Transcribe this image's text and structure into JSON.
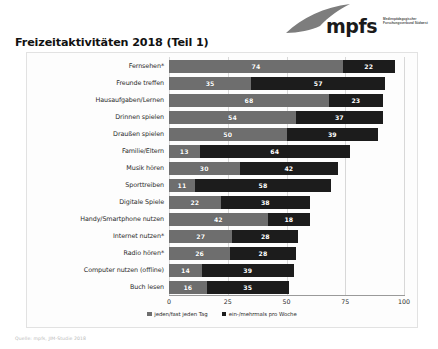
{
  "logo": {
    "wordmark": "mpfs",
    "subtext": "Medienpädagogischer Forschungsverbund Südwest",
    "swoosh_icon": "swoosh-icon",
    "color": "#6e6e6e"
  },
  "page_title": "Freizeitaktivitäten 2018 (Teil 1)",
  "footer_note": "Quelle: mpfs, JIM-Studie 2018",
  "colors": {
    "series_a": "#6e6e6e",
    "series_b": "#1c1c1c",
    "grid": "#d8d8d8",
    "axis": "#9a9a9a"
  },
  "chart_data": {
    "type": "bar",
    "orientation": "horizontal",
    "stacked": true,
    "title": "Freizeitaktivitäten 2018 (Teil 1)",
    "xlabel": "",
    "ylabel": "",
    "xlim": [
      0,
      100
    ],
    "xticks": [
      0,
      25,
      50,
      75,
      100
    ],
    "grid": true,
    "legend_position": "bottom",
    "categories": [
      "Fernsehen*",
      "Freunde treffen",
      "Hausaufgaben/Lernen",
      "Drinnen spielen",
      "Draußen spielen",
      "Familie/Eltern",
      "Musik hören",
      "Sporttreiben",
      "Digitale Spiele",
      "Handy/Smartphone nutzen",
      "Internet nutzen*",
      "Radio hören*",
      "Computer nutzen (offline)",
      "Buch lesen"
    ],
    "series": [
      {
        "name": "jeden/fast jeden Tag",
        "color": "#6e6e6e",
        "values": [
          74,
          35,
          68,
          54,
          50,
          13,
          30,
          11,
          22,
          42,
          27,
          26,
          14,
          16
        ]
      },
      {
        "name": "ein-/mehrmals pro Woche",
        "color": "#1c1c1c",
        "values": [
          22,
          57,
          23,
          37,
          39,
          64,
          42,
          58,
          38,
          18,
          28,
          28,
          39,
          35
        ]
      }
    ]
  }
}
